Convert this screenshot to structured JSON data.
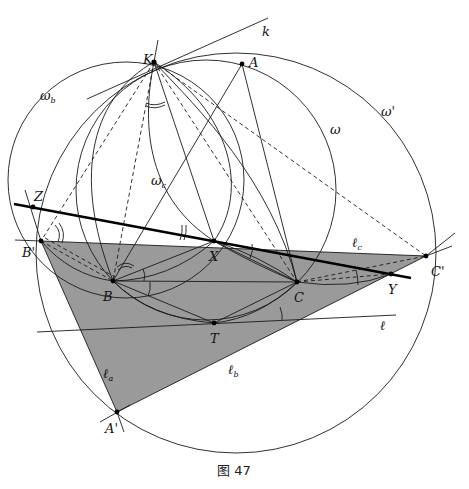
{
  "figure": {
    "caption": "图 47",
    "shade_color": "#9a9a9a",
    "line_color": "#1a1a1a"
  },
  "points": {
    "K": {
      "label": "K",
      "x": 154,
      "y": 62
    },
    "A": {
      "label": "A",
      "x": 242,
      "y": 64
    },
    "Z": {
      "label": "Z",
      "x": 33,
      "y": 207
    },
    "B_prime": {
      "label": "B'",
      "x": 41,
      "y": 241
    },
    "X": {
      "label": "X",
      "x": 214,
      "y": 241
    },
    "B": {
      "label": "B",
      "x": 113,
      "y": 281
    },
    "C": {
      "label": "C",
      "x": 297,
      "y": 282
    },
    "T": {
      "label": "T",
      "x": 214,
      "y": 323
    },
    "Y": {
      "label": "Y",
      "x": 391,
      "y": 274
    },
    "C_prime": {
      "label": "C'",
      "x": 426,
      "y": 256
    },
    "A_prime": {
      "label": "A'",
      "x": 117,
      "y": 412
    }
  },
  "curve_labels": {
    "omega": "ω",
    "omega_prime": "ω'",
    "omega_b": "ω",
    "omega_b_sub": "b",
    "omega_c": "ω",
    "omega_c_sub": "c",
    "k": "k",
    "ell": "ℓ",
    "ell_a": "ℓ",
    "ell_a_sub": "a",
    "ell_b": "ℓ",
    "ell_b_sub": "b",
    "ell_c": "ℓ",
    "ell_c_sub": "c"
  }
}
